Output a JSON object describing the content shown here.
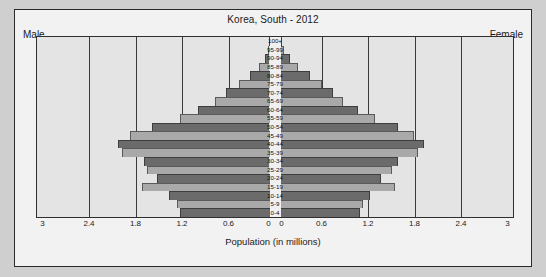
{
  "chart_data": {
    "type": "bar",
    "subtype": "population-pyramid",
    "title": "Korea, South - 2012",
    "xlabel": "Population (in millions)",
    "ylabel": "",
    "left_label": "Male",
    "right_label": "Female",
    "grid": true,
    "legend_position": "corners",
    "xlim": [
      -3,
      3
    ],
    "xlim_display_max": 3,
    "xticks": [
      3,
      2.4,
      1.8,
      1.2,
      0.6,
      0,
      0,
      0.6,
      1.2,
      1.8,
      2.4,
      3
    ],
    "xtick_labels": [
      "3",
      "2.4",
      "1.8",
      "1.2",
      "0.6",
      "0",
      "0",
      "0.6",
      "1.2",
      "1.8",
      "2.4",
      "3"
    ],
    "gridline_values": [
      2.4,
      1.8,
      1.2,
      0.6,
      0.6,
      1.2,
      1.8,
      2.4
    ],
    "colors": {
      "bar_dark": "#6b6b6b",
      "bar_light": "#a9a9a9",
      "plot_background": "#e4e4e4",
      "panel_background": "#f2f2f2",
      "page_background": "#cfcfcf",
      "axis": "#2f2f2f",
      "text": "#1a1a1a"
    },
    "categories": [
      "100+",
      "95-99",
      "90-94",
      "85-89",
      "80-84",
      "75-79",
      "70-74",
      "65-69",
      "60-64",
      "55-59",
      "50-54",
      "45-49",
      "40-44",
      "35-39",
      "30-34",
      "25-29",
      "20-24",
      "15-19",
      "10-14",
      "5-9",
      "0-4"
    ],
    "series": [
      {
        "name": "Male",
        "side": "left",
        "values": [
          0.004,
          0.02,
          0.06,
          0.13,
          0.25,
          0.4,
          0.56,
          0.7,
          0.92,
          1.15,
          1.52,
          1.8,
          1.96,
          1.9,
          1.62,
          1.58,
          1.45,
          1.65,
          1.3,
          1.2,
          1.15
        ]
      },
      {
        "name": "Female",
        "side": "right",
        "values": [
          0.012,
          0.05,
          0.12,
          0.23,
          0.38,
          0.54,
          0.68,
          0.8,
          1.0,
          1.22,
          1.52,
          1.72,
          1.85,
          1.78,
          1.52,
          1.44,
          1.3,
          1.48,
          1.16,
          1.06,
          1.02
        ]
      }
    ]
  }
}
